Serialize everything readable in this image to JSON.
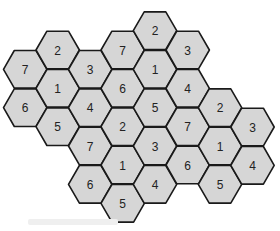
{
  "diagram": {
    "type": "hexagonal-cell-cluster",
    "hex_radius": 21.7,
    "colors": {
      "fill": "#d6d6d6",
      "stroke": "#1a1a1a",
      "text": "#222222"
    },
    "cells": [
      {
        "x": 25.2,
        "y": 69.3,
        "label": "7"
      },
      {
        "x": 25.2,
        "y": 107.7,
        "label": "6"
      },
      {
        "x": 57.7,
        "y": 50.0,
        "label": "2"
      },
      {
        "x": 57.7,
        "y": 88.3,
        "label": "1"
      },
      {
        "x": 57.7,
        "y": 126.7,
        "label": "5"
      },
      {
        "x": 90.2,
        "y": 69.3,
        "label": "3"
      },
      {
        "x": 90.2,
        "y": 107.7,
        "label": "4"
      },
      {
        "x": 90.2,
        "y": 146.0,
        "label": "7"
      },
      {
        "x": 90.2,
        "y": 184.3,
        "label": "6"
      },
      {
        "x": 122.7,
        "y": 50.0,
        "label": "7"
      },
      {
        "x": 122.7,
        "y": 88.3,
        "label": "6"
      },
      {
        "x": 122.7,
        "y": 126.7,
        "label": "2"
      },
      {
        "x": 122.7,
        "y": 165.0,
        "label": "1"
      },
      {
        "x": 122.7,
        "y": 203.3,
        "label": "5"
      },
      {
        "x": 155.0,
        "y": 30.7,
        "label": "2"
      },
      {
        "x": 155.0,
        "y": 69.3,
        "label": "1"
      },
      {
        "x": 155.0,
        "y": 107.7,
        "label": "5"
      },
      {
        "x": 155.0,
        "y": 146.0,
        "label": "3"
      },
      {
        "x": 155.0,
        "y": 184.3,
        "label": "4"
      },
      {
        "x": 187.7,
        "y": 50.0,
        "label": "3"
      },
      {
        "x": 187.7,
        "y": 88.3,
        "label": "4"
      },
      {
        "x": 187.7,
        "y": 126.7,
        "label": "7"
      },
      {
        "x": 187.7,
        "y": 165.0,
        "label": "6"
      },
      {
        "x": 220.0,
        "y": 107.7,
        "label": "2"
      },
      {
        "x": 220.0,
        "y": 146.0,
        "label": "1"
      },
      {
        "x": 220.0,
        "y": 184.3,
        "label": "5"
      },
      {
        "x": 252.5,
        "y": 127.0,
        "label": "3"
      },
      {
        "x": 252.5,
        "y": 165.3,
        "label": "4"
      }
    ]
  }
}
